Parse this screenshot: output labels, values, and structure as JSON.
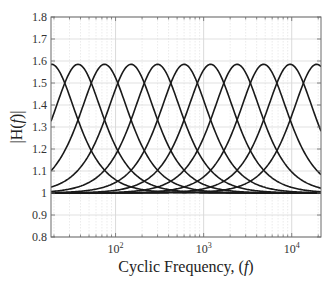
{
  "chart_data": {
    "type": "line",
    "title": "",
    "xlabel": "Cyclic Frequency, (f)",
    "xlabel_parts": {
      "prefix": "Cyclic Frequency, (",
      "italic": "f",
      "suffix": ")"
    },
    "ylabel": "|H(f)|",
    "ylabel_parts": {
      "prefix": "|H(",
      "italic": "f",
      "suffix": ")|"
    },
    "xscale": "log",
    "xlim": [
      18.5,
      21500
    ],
    "ylim": [
      0.8,
      1.8
    ],
    "yticks": [
      0.8,
      0.9,
      1,
      1.1,
      1.2,
      1.3,
      1.4,
      1.5,
      1.6,
      1.7,
      1.8
    ],
    "ytick_labels": [
      "0.8",
      "0.9",
      "1",
      "1.1",
      "1.2",
      "1.3",
      "1.4",
      "1.5",
      "1.6",
      "1.7",
      "1.8"
    ],
    "xticks": [
      100,
      1000,
      10000
    ],
    "xtick_labels": [
      {
        "base": "10",
        "exp": "2"
      },
      {
        "base": "10",
        "exp": "3"
      },
      {
        "base": "10",
        "exp": "4"
      }
    ],
    "grid": {
      "major": true,
      "minor": true,
      "color": "#d9d9d9",
      "minor_style": "dotted"
    },
    "legend": null,
    "line_color": "#1a1a1a",
    "series_model": "peaking-filter magnitude, peak gain 1.585, Q 0.65",
    "peak_gain": 1.585,
    "q": 0.65,
    "series": [
      {
        "name": "band-1",
        "center_hz": 18.75,
        "peak": 1.585
      },
      {
        "name": "band-2",
        "center_hz": 37.5,
        "peak": 1.585
      },
      {
        "name": "band-3",
        "center_hz": 75,
        "peak": 1.585
      },
      {
        "name": "band-4",
        "center_hz": 150,
        "peak": 1.585
      },
      {
        "name": "band-5",
        "center_hz": 300,
        "peak": 1.585
      },
      {
        "name": "band-6",
        "center_hz": 600,
        "peak": 1.585
      },
      {
        "name": "band-7",
        "center_hz": 1200,
        "peak": 1.585
      },
      {
        "name": "band-8",
        "center_hz": 2400,
        "peak": 1.585
      },
      {
        "name": "band-9",
        "center_hz": 4800,
        "peak": 1.585
      },
      {
        "name": "band-10",
        "center_hz": 9600,
        "peak": 1.585
      },
      {
        "name": "band-11",
        "center_hz": 19200,
        "peak": 1.585
      }
    ]
  },
  "plot_area": {
    "left": 51,
    "top": 17,
    "right": 321,
    "bottom": 237
  }
}
